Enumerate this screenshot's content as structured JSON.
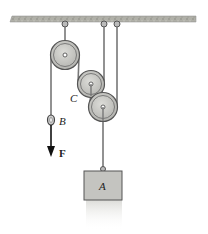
{
  "diagram": {
    "type": "pulley-system",
    "labels": {
      "pulley_c": "C",
      "ring_b": "B",
      "force": "F",
      "block": "A"
    },
    "colors": {
      "ceiling": "#a8a8a0",
      "pulley_fill": "#c8c8c4",
      "pulley_stroke": "#555555",
      "rope": "#777777",
      "block_fill": "#c4c4c0",
      "arrow": "#111111"
    }
  }
}
